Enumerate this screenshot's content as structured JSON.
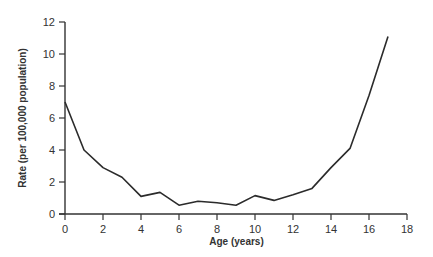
{
  "chart_data": {
    "type": "line",
    "title": "",
    "xlabel": "Age (years)",
    "ylabel": "Rate (per 100,000 population)",
    "xlim": [
      0,
      18
    ],
    "ylim": [
      0,
      12
    ],
    "x_ticks": [
      0,
      2,
      4,
      6,
      8,
      10,
      12,
      14,
      16,
      18
    ],
    "y_ticks": [
      0,
      2,
      4,
      6,
      8,
      10,
      12
    ],
    "grid": false,
    "legend": null,
    "series": [
      {
        "name": "Rate",
        "color": "#2b2b2b",
        "x": [
          0,
          1,
          2,
          3,
          4,
          5,
          6,
          7,
          8,
          9,
          10,
          11,
          12,
          13,
          14,
          15,
          16,
          17
        ],
        "values": [
          7.0,
          4.0,
          2.9,
          2.3,
          1.1,
          1.35,
          0.55,
          0.8,
          0.7,
          0.55,
          1.15,
          0.85,
          1.2,
          1.6,
          2.9,
          4.1,
          7.4,
          11.1
        ]
      }
    ]
  },
  "colors": {
    "axis": "#333333",
    "line": "#2b2b2b",
    "background": "#ffffff"
  }
}
